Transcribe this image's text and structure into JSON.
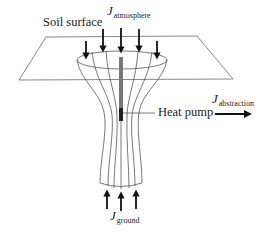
{
  "diagram": {
    "type": "heat-pump-soil-energy-flux-schematic",
    "labels": {
      "soil_surface": "Soil surface",
      "heat_pump": "Heat pump",
      "flux_symbol": "J",
      "atmosphere_sub": "atmosphere",
      "abstraction_sub": "abstraction",
      "ground_sub": "ground"
    },
    "arrows": {
      "atmosphere": {
        "count": 5,
        "direction": "down"
      },
      "ground": {
        "count": 3,
        "direction": "up"
      },
      "abstraction": {
        "count": 1,
        "direction": "right"
      }
    },
    "colors": {
      "line": "#555555",
      "arrow": "#111111",
      "pipe": "#777777",
      "pipe_dark": "#222222",
      "text": "#222222"
    }
  }
}
